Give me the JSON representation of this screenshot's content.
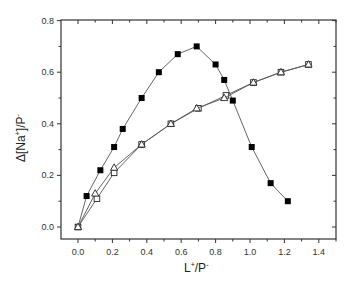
{
  "chart_data": {
    "type": "line",
    "title": "",
    "xlabel": "L+/P-",
    "ylabel": "Δ[Na+]/P-",
    "xlabel_parts": {
      "base": "L",
      "sup1": "+",
      "mid": "/P",
      "sup2": "-"
    },
    "ylabel_parts": {
      "base": "Δ[Na",
      "sup1": "+",
      "mid": "]/P",
      "sup2": "-"
    },
    "xlim": [
      -0.1,
      1.5
    ],
    "ylim": [
      -0.05,
      0.8
    ],
    "x_ticks": [
      "0.0",
      "0.2",
      "0.4",
      "0.6",
      "0.8",
      "1.0",
      "1.2",
      "1.4"
    ],
    "x_tick_values": [
      0.0,
      0.2,
      0.4,
      0.6,
      0.8,
      1.0,
      1.2,
      1.4
    ],
    "y_ticks": [
      "0.0",
      "0.2",
      "0.4",
      "0.6",
      "0.8"
    ],
    "y_tick_values": [
      0.0,
      0.2,
      0.4,
      0.6,
      0.8
    ],
    "grid": false,
    "legend": null,
    "series": [
      {
        "name": "filled squares",
        "marker": "square-filled",
        "color": "#000000",
        "x": [
          0.0,
          0.05,
          0.13,
          0.21,
          0.26,
          0.37,
          0.47,
          0.58,
          0.69,
          0.8,
          0.85,
          0.9,
          1.01,
          1.12,
          1.22
        ],
        "y": [
          0.0,
          0.12,
          0.22,
          0.31,
          0.38,
          0.5,
          0.6,
          0.67,
          0.7,
          0.63,
          0.57,
          0.49,
          0.31,
          0.17,
          0.1
        ]
      },
      {
        "name": "open squares",
        "marker": "square-open",
        "color": "#000000",
        "x": [
          0.0,
          0.11,
          0.21,
          0.37,
          0.54,
          0.7,
          0.86,
          1.02,
          1.18,
          1.34
        ],
        "y": [
          0.0,
          0.11,
          0.21,
          0.32,
          0.4,
          0.46,
          0.51,
          0.56,
          0.6,
          0.63
        ]
      },
      {
        "name": "open triangles",
        "marker": "triangle-open",
        "color": "#000000",
        "x": [
          0.0,
          0.1,
          0.21,
          0.37,
          0.54,
          0.69,
          0.85,
          1.02,
          1.18,
          1.34
        ],
        "y": [
          0.0,
          0.13,
          0.23,
          0.32,
          0.4,
          0.46,
          0.5,
          0.56,
          0.6,
          0.63
        ]
      }
    ]
  }
}
